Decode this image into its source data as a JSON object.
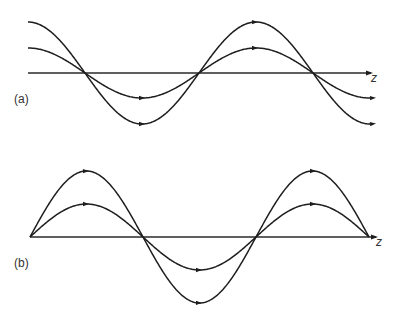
{
  "figure": {
    "panels": [
      {
        "id": "a",
        "label": "(a)",
        "axis_label": "z",
        "axis": {
          "y": 73,
          "x_start": 28,
          "x_end": 373
        },
        "label_pos": {
          "x": 14,
          "y": 103
        },
        "axis_label_pos": {
          "x": 371,
          "y": 82
        },
        "shape": "cosine",
        "x_start": 28,
        "x_end": 373,
        "wavelength": 228,
        "waves": [
          {
            "name": "large-amplitude-wave",
            "amplitude": 51,
            "arrow_x": [
              142,
              255,
              373
            ]
          },
          {
            "name": "small-amplitude-wave",
            "amplitude": 25,
            "arrow_x": [
              142,
              255,
              373
            ]
          }
        ],
        "zero_crossings_x": [
          85,
          200,
          313
        ]
      },
      {
        "id": "b",
        "label": "(b)",
        "axis_label": "z",
        "axis": {
          "y": 237,
          "x_start": 30,
          "x_end": 378
        },
        "label_pos": {
          "x": 14,
          "y": 267
        },
        "axis_label_pos": {
          "x": 376,
          "y": 246
        },
        "shape": "sine",
        "x_start": 30,
        "x_end": 369,
        "wavelength": 226,
        "waves": [
          {
            "name": "large-amplitude-wave",
            "amplitude": 66,
            "arrow_x": [
              86,
              199,
              313
            ]
          },
          {
            "name": "small-amplitude-wave",
            "amplitude": 33,
            "arrow_x": [
              86,
              199,
              313
            ]
          }
        ],
        "zero_crossings_x": [
          30,
          142,
          257,
          369
        ]
      }
    ],
    "colors": {
      "stroke": "#1e1e1e",
      "background": "#ffffff"
    }
  }
}
